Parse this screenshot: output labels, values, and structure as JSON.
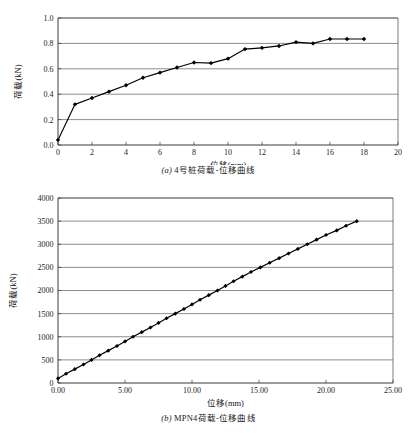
{
  "page": {
    "background": "#ffffff",
    "width": 417,
    "height": 441
  },
  "figures": [
    {
      "id": "figure-a",
      "caption_label": "(a)",
      "caption_text": " 4号桩荷载-位移曲线",
      "caption_full": "(a) 4号桩荷载-位移曲线"
    },
    {
      "id": "figure-b",
      "caption_label": "(b)",
      "caption_text": " MPN4荷载-位移曲线",
      "caption_full": "(b) MPN4荷载-位移曲线"
    }
  ],
  "chart_data": [
    {
      "type": "line",
      "id": "chart-a",
      "title": "",
      "xlabel": "位移(mm)",
      "ylabel": "荷载(kN)",
      "xlim": [
        0,
        20
      ],
      "ylim": [
        0,
        1.0
      ],
      "xticks": [
        0,
        2,
        4,
        6,
        8,
        10,
        12,
        14,
        16,
        18,
        20
      ],
      "xtick_labels": [
        "0",
        "2",
        "4",
        "6",
        "8",
        "10",
        "12",
        "14",
        "16",
        "18",
        "20"
      ],
      "yticks": [
        0.0,
        0.2,
        0.4,
        0.6,
        0.8,
        1.0
      ],
      "ytick_labels": [
        "0.0",
        "0.2",
        "0.4",
        "0.6",
        "0.8",
        "1.0"
      ],
      "grid": "horizontal",
      "legend": "none",
      "marker": "diamond",
      "line_color": "#000000",
      "x": [
        0.0,
        1.0,
        2.0,
        3.0,
        4.0,
        5.0,
        6.0,
        7.0,
        8.0,
        9.0,
        10.0,
        11.0,
        12.0,
        13.0,
        14.0,
        15.0,
        16.0,
        17.0,
        18.0
      ],
      "y": [
        0.04,
        0.32,
        0.37,
        0.42,
        0.47,
        0.53,
        0.57,
        0.61,
        0.65,
        0.645,
        0.68,
        0.755,
        0.765,
        0.78,
        0.81,
        0.8,
        0.835,
        0.835,
        0.835
      ]
    },
    {
      "type": "line",
      "id": "chart-b",
      "title": "",
      "xlabel": "位移(mm)",
      "ylabel": "荷载(kN)",
      "xlim": [
        0,
        25
      ],
      "ylim": [
        0,
        4000
      ],
      "xticks": [
        0,
        5,
        10,
        15,
        20,
        25
      ],
      "xtick_labels": [
        "0.00",
        "5.00",
        "10.00",
        "15.00",
        "20.00",
        "25.00"
      ],
      "yticks": [
        0,
        500,
        1000,
        1500,
        2000,
        2500,
        3000,
        3500,
        4000
      ],
      "ytick_labels": [
        "0",
        "500",
        "1000",
        "1500",
        "2000",
        "2500",
        "3000",
        "3500",
        "4000"
      ],
      "grid": "horizontal",
      "legend": "none",
      "marker": "diamond",
      "line_color": "#000000",
      "x": [
        0.0,
        0.6,
        1.25,
        1.9,
        2.5,
        3.1,
        3.75,
        4.4,
        5.0,
        5.6,
        6.25,
        6.9,
        7.5,
        8.1,
        8.75,
        9.4,
        10.0,
        10.6,
        11.25,
        11.9,
        12.5,
        13.1,
        13.75,
        14.4,
        15.1,
        15.8,
        16.5,
        17.2,
        17.9,
        18.6,
        19.3,
        20.0,
        20.8,
        21.5,
        22.3
      ],
      "y": [
        100,
        200,
        300,
        400,
        500,
        600,
        700,
        800,
        900,
        1000,
        1100,
        1200,
        1300,
        1400,
        1500,
        1600,
        1700,
        1800,
        1900,
        2000,
        2100,
        2200,
        2300,
        2400,
        2500,
        2600,
        2700,
        2800,
        2900,
        3000,
        3100,
        3200,
        3300,
        3400,
        3500
      ]
    }
  ]
}
